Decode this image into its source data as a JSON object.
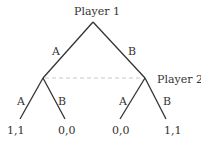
{
  "tree": {
    "root_player": "Player 1",
    "second_player": "Player 2",
    "root_branches": {
      "left": "A",
      "right": "B"
    },
    "left_node_branches": {
      "left": "A",
      "right": "B"
    },
    "right_node_branches": {
      "left": "A",
      "right": "B"
    },
    "payoffs": [
      "1,1",
      "0,0",
      "0,0",
      "1,1"
    ],
    "info_set_line_color": "#cccccc",
    "edge_color": "#333333"
  }
}
